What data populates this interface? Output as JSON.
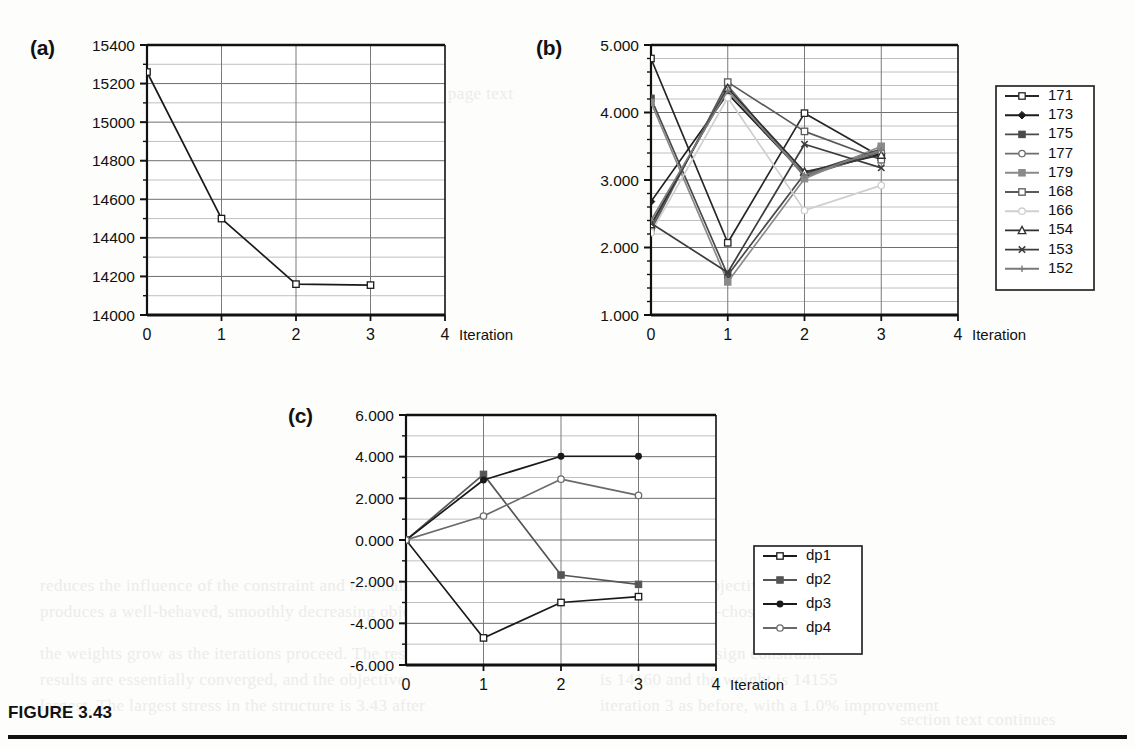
{
  "figure": {
    "caption": "FIGURE 3.43",
    "panel_a_tag": "(a)",
    "panel_b_tag": "(b)",
    "panel_c_tag": "(c)",
    "axis_name": "Iteration"
  },
  "bleed_text": [
    {
      "x": 40,
      "y": 572,
      "t": "reduces the influence of the constraint and maintains"
    },
    {
      "x": 40,
      "y": 598,
      "t": "produces a well-behaved, smoothly decreasing objective"
    },
    {
      "x": 40,
      "y": 640,
      "t": "the weights grow as the iterations proceed. The resu"
    },
    {
      "x": 40,
      "y": 666,
      "t": "results are essentially converged, and the objective"
    },
    {
      "x": 40,
      "y": 692,
      "t": "largest. The largest stress in the structure is 3.43 after"
    },
    {
      "x": 600,
      "y": 572,
      "t": "a value of the objective function"
    },
    {
      "x": 600,
      "y": 598,
      "t": "function. A well-chosen weight"
    },
    {
      "x": 600,
      "y": 640,
      "t": "to violate the design constraint"
    },
    {
      "x": 600,
      "y": 666,
      "t": "is 14160 and the weight is 14155"
    },
    {
      "x": 600,
      "y": 692,
      "t": "iteration 3 as before, with a 1.0% improvement"
    },
    {
      "x": 230,
      "y": 80,
      "t": "faint show-through of reverse page text"
    },
    {
      "x": 900,
      "y": 706,
      "t": "section text continues"
    }
  ],
  "chart_data": [
    {
      "id": "a",
      "type": "line",
      "title": "(a)",
      "xlabel": "Iteration",
      "ylabel": "",
      "x": [
        0,
        1,
        2,
        3
      ],
      "xlim": [
        0,
        4
      ],
      "ylim": [
        14000,
        15400
      ],
      "ytick_values": [
        14000,
        14200,
        14400,
        14600,
        14800,
        15000,
        15200,
        15400
      ],
      "ytick_labels": [
        "14000",
        "14200",
        "14400",
        "14600",
        "14800",
        "15000",
        "15200",
        "15400"
      ],
      "xtick_values": [
        0,
        1,
        2,
        3,
        4
      ],
      "xtick_labels": [
        "0",
        "1",
        "2",
        "3",
        "4"
      ],
      "y_minor_step": 100,
      "grid": true,
      "legend": false,
      "series": [
        {
          "name": "objective",
          "marker": "open-square",
          "color": "#1a1a1a",
          "values": [
            15260,
            14500,
            14160,
            14155
          ]
        }
      ]
    },
    {
      "id": "b",
      "type": "line",
      "title": "(b)",
      "xlabel": "Iteration",
      "ylabel": "",
      "x": [
        0,
        1,
        2,
        3
      ],
      "xlim": [
        0,
        4
      ],
      "ylim": [
        1.0,
        5.0
      ],
      "ytick_values": [
        1.0,
        2.0,
        3.0,
        4.0,
        5.0
      ],
      "ytick_labels": [
        "1.000",
        "2.000",
        "3.000",
        "4.000",
        "5.000"
      ],
      "xtick_values": [
        0,
        1,
        2,
        3,
        4
      ],
      "xtick_labels": [
        "0",
        "1",
        "2",
        "3",
        "4"
      ],
      "y_minor_step": 0.2,
      "grid": true,
      "legend": true,
      "legend_position": "right",
      "series": [
        {
          "name": "171",
          "marker": "open-square",
          "color": "#262626",
          "values": [
            4.8,
            2.07,
            3.99,
            3.34
          ]
        },
        {
          "name": "173",
          "marker": "filled-diamond",
          "color": "#1c1c1c",
          "values": [
            2.68,
            4.28,
            3.08,
            3.39
          ]
        },
        {
          "name": "175",
          "marker": "filled-square",
          "color": "#4a4a4a",
          "values": [
            4.21,
            1.59,
            3.09,
            3.46
          ]
        },
        {
          "name": "177",
          "marker": "open-circle",
          "color": "#6d6d6d",
          "values": [
            2.3,
            4.4,
            3.05,
            3.42
          ]
        },
        {
          "name": "179",
          "marker": "filled-square",
          "color": "#8a8a8a",
          "values": [
            4.15,
            1.49,
            3.02,
            3.5
          ]
        },
        {
          "name": "168",
          "marker": "open-square",
          "color": "#5a5a5a",
          "values": [
            2.25,
            4.45,
            3.72,
            3.3
          ]
        },
        {
          "name": "166",
          "marker": "open-circle",
          "color": "#cfcfcf",
          "values": [
            2.22,
            4.22,
            2.55,
            2.92
          ]
        },
        {
          "name": "154",
          "marker": "open-triangle",
          "color": "#303030",
          "values": [
            2.34,
            4.36,
            3.12,
            3.37
          ]
        },
        {
          "name": "153",
          "marker": "cross-x",
          "color": "#3c3c3c",
          "values": [
            2.36,
            1.63,
            3.53,
            3.18
          ]
        },
        {
          "name": "152",
          "marker": "plus",
          "color": "#7a7a7a",
          "values": [
            2.4,
            4.33,
            3.07,
            3.44
          ]
        }
      ]
    },
    {
      "id": "c",
      "type": "line",
      "title": "(c)",
      "xlabel": "Iteration",
      "ylabel": "",
      "x": [
        0,
        1,
        2,
        3
      ],
      "xlim": [
        0,
        4
      ],
      "ylim": [
        -6.0,
        6.0
      ],
      "ytick_values": [
        -6.0,
        -4.0,
        -2.0,
        0.0,
        2.0,
        4.0,
        6.0
      ],
      "ytick_labels": [
        "-6.000",
        "-4.000",
        "-2.000",
        "0.000",
        "2.000",
        "4.000",
        "6.000"
      ],
      "xtick_values": [
        0,
        1,
        2,
        3,
        4
      ],
      "xtick_labels": [
        "0",
        "1",
        "2",
        "3",
        "4"
      ],
      "y_minor_step": 1.0,
      "grid": true,
      "legend": true,
      "legend_position": "right",
      "series": [
        {
          "name": "dp1",
          "marker": "open-square",
          "color": "#1a1a1a",
          "values": [
            0.0,
            -4.7,
            -3.0,
            -2.72
          ]
        },
        {
          "name": "dp2",
          "marker": "filled-square",
          "color": "#555555",
          "values": [
            0.0,
            3.15,
            -1.68,
            -2.13
          ]
        },
        {
          "name": "dp3",
          "marker": "filled-circle",
          "color": "#1a1a1a",
          "values": [
            0.0,
            2.88,
            4.02,
            4.02
          ]
        },
        {
          "name": "dp4",
          "marker": "open-circle",
          "color": "#6a6a6a",
          "values": [
            0.0,
            1.15,
            2.92,
            2.14
          ]
        }
      ]
    }
  ]
}
